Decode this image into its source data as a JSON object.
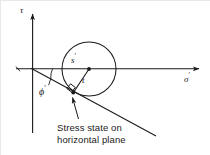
{
  "figure": {
    "type": "mohr-circle-diagram",
    "background_color": "#ffffff",
    "stroke_color": "#1a1a1a",
    "axes": {
      "vertical_label": "τ",
      "vertical_label_prime": "",
      "horizontal_label": "σ",
      "horizontal_label_prime": "′"
    },
    "labels": {
      "center_label": "s",
      "center_label_prime": "′",
      "radius_label": "t",
      "friction_angle_label": "ϕ",
      "friction_angle_prime": "′"
    },
    "caption": {
      "line1": "Stress state on",
      "line2": "horizontal plane"
    },
    "geometry": {
      "origin_x": 33,
      "origin_y": 69,
      "circle_center_x": 89,
      "circle_center_y": 69,
      "circle_radius": 27,
      "tangent_point_x": 73.3,
      "tangent_point_y": 92.6,
      "failure_line_end_x": 156,
      "failure_line_end_y": 136,
      "sigma_axis_end_x": 203,
      "tau_axis_top_y": 10
    }
  }
}
